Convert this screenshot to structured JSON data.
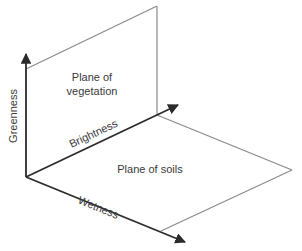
{
  "diagram": {
    "title": "",
    "axes": {
      "greenness": {
        "label": "Greenness"
      },
      "brightness": {
        "label": "Brightness"
      },
      "wetness": {
        "label": "Wetness"
      }
    },
    "planes": {
      "vegetation": {
        "label_line1": "Plane of",
        "label_line2": "vegetation"
      },
      "soils": {
        "label": "Plane of soils"
      }
    },
    "colors": {
      "axis": "#2b2b2b",
      "plane_edge": "#8a8a8a",
      "text": "#3a3a3a",
      "background": "#ffffff"
    }
  }
}
